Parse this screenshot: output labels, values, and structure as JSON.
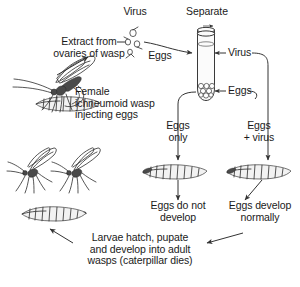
{
  "figure": {
    "labels": {
      "extract": "Extract from\novaries of wasp",
      "virus_top": "Virus",
      "eggs_near_extract": "Eggs",
      "separate": "Separate",
      "tube_virus": "Virus",
      "tube_eggs": "Eggs",
      "female_wasp": "Female\nichneumoid wasp\ninjecting eggs",
      "branch_left": "Eggs\nonly",
      "branch_right": "Eggs\n+ virus",
      "outcome_left": "Eggs do not\ndevelop",
      "outcome_right": "Eggs develop\nnormally",
      "bottom": "Larvae hatch, pupate\nand develop into adult\nwasps (caterpillar dies)"
    },
    "illustrations": [
      {
        "name": "female-wasp-on-caterpillar",
        "caption": "Female ichneumoid wasp injecting eggs"
      },
      {
        "name": "two-adult-wasps",
        "caption": "Adult wasps"
      },
      {
        "name": "left-larva",
        "caption": "Larva"
      },
      {
        "name": "caterpillar-eggs-only",
        "caption": "Caterpillar injected with eggs only"
      },
      {
        "name": "caterpillar-eggs-plus-virus",
        "caption": "Caterpillar injected with eggs + virus"
      },
      {
        "name": "test-tube",
        "caption": "Centrifuge tube separating virus from eggs"
      },
      {
        "name": "virus-particles",
        "caption": "Virus particles extracted from wasp ovaries"
      }
    ],
    "colors": {
      "ink": "#1a1a1a",
      "line": "#333333",
      "background": "#ffffff"
    }
  }
}
